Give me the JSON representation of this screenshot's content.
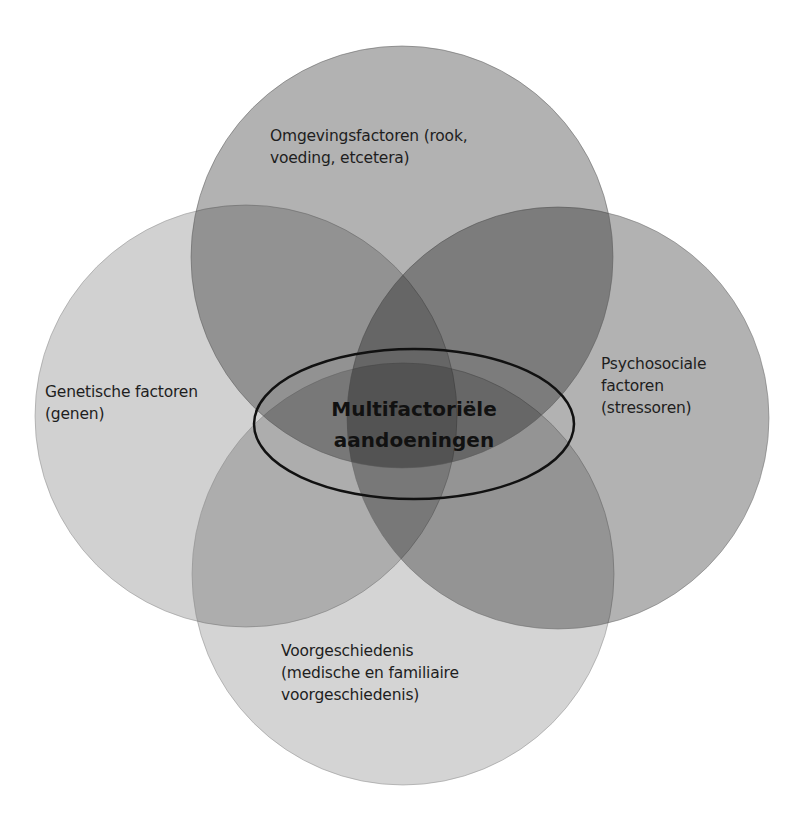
{
  "diagram": {
    "type": "venn-4-circles",
    "center": {
      "label": "Multifactoriële\naandoeningen"
    },
    "circles": [
      {
        "id": "top",
        "label": "Omgevingsfactoren (rook,\nvoeding, etcetera)",
        "color": "#9e9e9e"
      },
      {
        "id": "left",
        "label": "Genetische factoren\n(genen)",
        "color": "#d0d0d0"
      },
      {
        "id": "right",
        "label": "Psychosociale\nfactoren\n(stressoren)",
        "color": "#a7a7a7"
      },
      {
        "id": "bottom",
        "label": "Voorgeschiedenis\n(medische en familiaire\nvoorgeschiedenis)",
        "color": "#d2d2d2"
      }
    ],
    "ellipse_stroke": "#111111"
  }
}
